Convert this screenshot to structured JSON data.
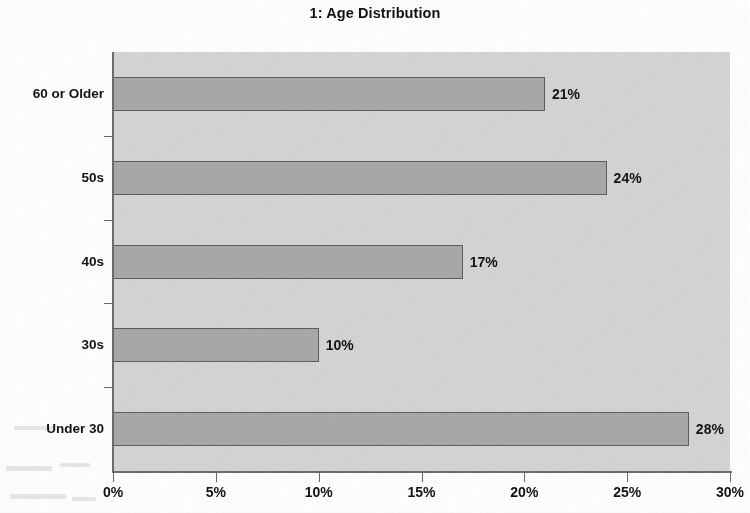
{
  "chart_data": {
    "type": "bar",
    "orientation": "horizontal",
    "title": "1: Age Distribution",
    "xlabel": "",
    "ylabel": "",
    "categories": [
      "Under 30",
      "30s",
      "40s",
      "50s",
      "60 or Older"
    ],
    "values": [
      28,
      10,
      17,
      24,
      21
    ],
    "value_labels": [
      "28%",
      "10%",
      "17%",
      "24%",
      "21%"
    ],
    "xlim": [
      0,
      30
    ],
    "xticks": [
      0,
      5,
      10,
      15,
      20,
      25,
      30
    ],
    "xtick_labels": [
      "0%",
      "5%",
      "10%",
      "15%",
      "20%",
      "25%",
      "30%"
    ],
    "grid": false,
    "legend": false,
    "series": [
      {
        "name": "Age Distribution",
        "values": [
          28,
          10,
          17,
          24,
          21
        ]
      }
    ],
    "colors": {
      "bar_fill": "#a9a9a9",
      "bar_border": "#5e5e5e",
      "plot_background": "#d5d5d5",
      "page_background": "#ffffff",
      "axis": "#6d6d6d",
      "text": "#131313"
    }
  }
}
